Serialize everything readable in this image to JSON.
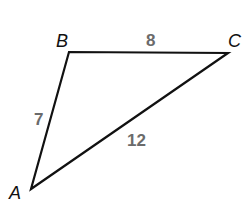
{
  "diagram": {
    "type": "triangle",
    "vertices": {
      "A": {
        "label": "A",
        "x": 31,
        "y": 189
      },
      "B": {
        "label": "B",
        "x": 69,
        "y": 52
      },
      "C": {
        "label": "C",
        "x": 228,
        "y": 53
      }
    },
    "sides": {
      "AB": {
        "label": "7"
      },
      "BC": {
        "label": "8"
      },
      "AC": {
        "label": "12"
      }
    },
    "colors": {
      "stroke": "#111111",
      "vertex_label": "#111111",
      "side_label": "#6b6b6b",
      "background": "#ffffff"
    }
  }
}
